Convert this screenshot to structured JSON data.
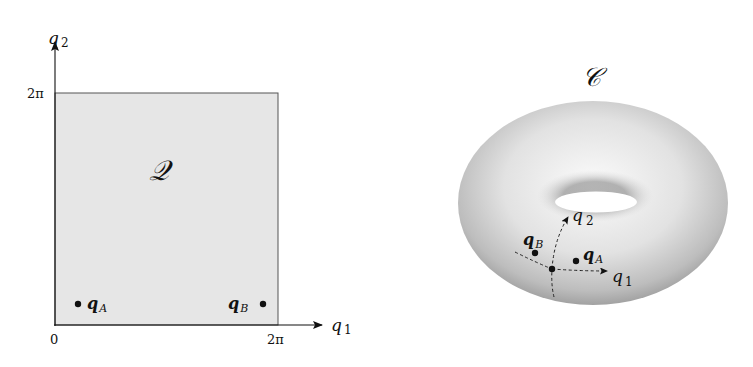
{
  "left_panel": {
    "space_label": "𝒬",
    "axis_x": {
      "label_base": "q",
      "label_sub": "1",
      "tick_start": "0",
      "tick_end": "2π"
    },
    "axis_y": {
      "label_base": "q",
      "label_sub": "2",
      "tick_end": "2π"
    },
    "points": [
      {
        "name": "qA",
        "base": "q",
        "sub": "A"
      },
      {
        "name": "qB",
        "base": "q",
        "sub": "B"
      }
    ],
    "fill_color": "#e6e6e6"
  },
  "right_panel": {
    "space_label": "𝒞",
    "axis_q1": {
      "base": "q",
      "sub": "1"
    },
    "axis_q2": {
      "base": "q",
      "sub": "2"
    },
    "points": [
      {
        "name": "qA",
        "base": "q",
        "sub": "A"
      },
      {
        "name": "qB",
        "base": "q",
        "sub": "B"
      }
    ]
  }
}
